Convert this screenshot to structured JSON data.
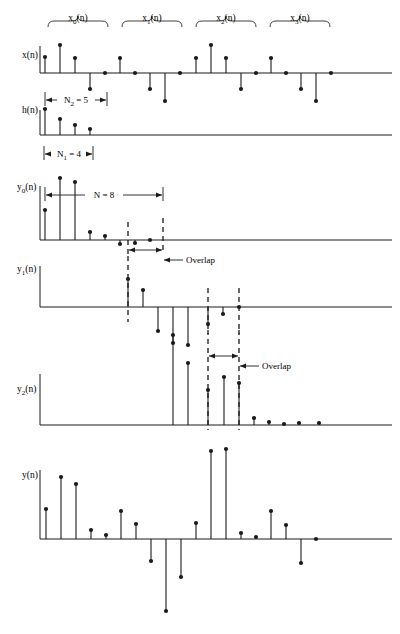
{
  "figure": {
    "width": 400,
    "height": 634,
    "ink_color": "#1a1a1a",
    "background": "#ffffff",
    "sample_spacing": 15
  },
  "braces": [
    {
      "name": "x0",
      "label_base": "x",
      "label_sub": "0",
      "label_tail": "(n)",
      "label_full": "x₀(n)",
      "x_start": 48,
      "x_end": 108,
      "label_x": 78,
      "label_y": 21,
      "y": 27
    },
    {
      "name": "x1",
      "label_base": "x",
      "label_sub": "1",
      "label_tail": "(n)",
      "label_full": "x₁(n)",
      "x_start": 122,
      "x_end": 182,
      "label_x": 152,
      "label_y": 21,
      "y": 27
    },
    {
      "name": "x2",
      "label_base": "x",
      "label_sub": "2",
      "label_tail": "(n)",
      "label_full": "x₂(n)",
      "x_start": 196,
      "x_end": 256,
      "label_x": 226,
      "label_y": 21,
      "y": 27
    },
    {
      "name": "x3",
      "label_base": "x",
      "label_sub": "3",
      "label_tail": "(n)",
      "label_full": "x₃(n)",
      "x_start": 270,
      "x_end": 330,
      "label_x": 300,
      "label_y": 21,
      "y": 27
    }
  ],
  "rows": [
    {
      "name": "x-of-n",
      "label_base": "x",
      "label_sub": "",
      "label_tail": "(n)",
      "label_full": "x(n)",
      "label_x": 22,
      "label_y": 58,
      "baseline_y": 73,
      "axis_x_start": 40,
      "axis_x_end": 392,
      "axis_left_cap_top": 46,
      "stems": [
        {
          "x": 45,
          "value": 16
        },
        {
          "x": 60,
          "value": 28
        },
        {
          "x": 75,
          "value": 15
        },
        {
          "x": 90,
          "value": -16
        },
        {
          "x": 105,
          "value": 0
        },
        {
          "x": 120,
          "value": 15
        },
        {
          "x": 135,
          "value": 0
        },
        {
          "x": 150,
          "value": -16
        },
        {
          "x": 165,
          "value": -28
        },
        {
          "x": 180,
          "value": 0
        },
        {
          "x": 196,
          "value": 15
        },
        {
          "x": 211,
          "value": 28
        },
        {
          "x": 226,
          "value": 15
        },
        {
          "x": 241,
          "value": -16
        },
        {
          "x": 256,
          "value": 0
        },
        {
          "x": 271,
          "value": 15
        },
        {
          "x": 286,
          "value": 0
        },
        {
          "x": 301,
          "value": -16
        },
        {
          "x": 316,
          "value": -28
        },
        {
          "x": 331,
          "value": 0
        }
      ]
    },
    {
      "name": "h-of-n",
      "label_base": "h",
      "label_sub": "",
      "label_tail": "(n)",
      "label_full": "h(n)",
      "label_x": 22,
      "label_y": 113,
      "baseline_y": 135,
      "axis_x_start": 40,
      "axis_x_end": 392,
      "axis_left_cap_top": 110,
      "stems": [
        {
          "x": 45,
          "value": 26
        },
        {
          "x": 60,
          "value": 16
        },
        {
          "x": 75,
          "value": 10
        },
        {
          "x": 90,
          "value": 6
        }
      ]
    },
    {
      "name": "y0-of-n",
      "label_base": "y",
      "label_sub": "0",
      "label_tail": "(n)",
      "label_full": "y₀(n)",
      "label_x": 17,
      "label_y": 190,
      "baseline_y": 240,
      "axis_x_start": 40,
      "axis_x_end": 392,
      "axis_left_cap_top": 186,
      "stems": [
        {
          "x": 45,
          "value": 30
        },
        {
          "x": 60,
          "value": 62
        },
        {
          "x": 75,
          "value": 58
        },
        {
          "x": 90,
          "value": 8
        },
        {
          "x": 105,
          "value": 4
        },
        {
          "x": 120,
          "value": -4
        },
        {
          "x": 135,
          "value": -3
        },
        {
          "x": 150,
          "value": 0
        }
      ]
    },
    {
      "name": "y1-of-n",
      "label_base": "y",
      "label_sub": "1",
      "label_tail": "(n)",
      "label_full": "y₁(n)",
      "label_x": 17,
      "label_y": 272,
      "baseline_y": 307,
      "axis_x_start": 40,
      "axis_x_end": 392,
      "axis_left_cap_top": 266,
      "stems": [
        {
          "x": 128,
          "value": 28
        },
        {
          "x": 143,
          "value": 17
        },
        {
          "x": 158,
          "value": -24
        },
        {
          "x": 173,
          "value": -36
        },
        {
          "x": 188,
          "value": -38
        },
        {
          "x": 208,
          "value": -17
        },
        {
          "x": 223,
          "value": -7
        },
        {
          "x": 239,
          "value": 0
        }
      ]
    },
    {
      "name": "y2-of-n",
      "label_base": "y",
      "label_sub": "2",
      "label_tail": "(n)",
      "label_full": "y₂(n)",
      "label_x": 17,
      "label_y": 392,
      "baseline_y": 425,
      "axis_x_start": 40,
      "axis_x_end": 392,
      "axis_left_cap_top": 374,
      "stems": [
        {
          "x": 173,
          "value": 90
        },
        {
          "x": 188,
          "value": 62
        },
        {
          "x": 208,
          "value": 35
        },
        {
          "x": 224,
          "value": 48
        },
        {
          "x": 239,
          "value": 42
        },
        {
          "x": 254,
          "value": 7
        },
        {
          "x": 269,
          "value": 3
        },
        {
          "x": 284,
          "value": 1
        },
        {
          "x": 299,
          "value": 2
        },
        {
          "x": 319,
          "value": 2
        }
      ]
    },
    {
      "name": "y-of-n",
      "label_base": "y",
      "label_sub": "",
      "label_tail": "(n)",
      "label_full": "y(n)",
      "label_x": 22,
      "label_y": 478,
      "baseline_y": 539,
      "axis_x_start": 40,
      "axis_x_end": 392,
      "axis_left_cap_top": 470,
      "stems": [
        {
          "x": 46,
          "value": 30
        },
        {
          "x": 61,
          "value": 62
        },
        {
          "x": 76,
          "value": 55
        },
        {
          "x": 91,
          "value": 9
        },
        {
          "x": 106,
          "value": 4
        },
        {
          "x": 121,
          "value": 28
        },
        {
          "x": 136,
          "value": 15
        },
        {
          "x": 151,
          "value": -22
        },
        {
          "x": 166,
          "value": -72
        },
        {
          "x": 181,
          "value": -38
        },
        {
          "x": 196,
          "value": 16
        },
        {
          "x": 211,
          "value": 88
        },
        {
          "x": 226,
          "value": 90
        },
        {
          "x": 241,
          "value": 6
        },
        {
          "x": 256,
          "value": 2
        },
        {
          "x": 271,
          "value": 28
        },
        {
          "x": 286,
          "value": 14
        },
        {
          "x": 301,
          "value": -24
        },
        {
          "x": 316,
          "value": 0
        }
      ]
    }
  ],
  "dashed_markers": [
    {
      "name": "y0-dash-left",
      "x": 128,
      "y_top": 222,
      "y_bottom": 258
    },
    {
      "name": "y0-dash-right",
      "x": 163,
      "y_top": 218,
      "y_bottom": 252
    },
    {
      "name": "y1-dash-left",
      "x": 128,
      "y_top": 256,
      "y_bottom": 322
    },
    {
      "name": "y1-dash-mid",
      "x": 208,
      "y_top": 288,
      "y_bottom": 334
    },
    {
      "name": "y1-dash-right",
      "x": 239,
      "y_top": 288,
      "y_bottom": 334
    },
    {
      "name": "y2-dash-left",
      "x": 208,
      "y_top": 330,
      "y_bottom": 430
    },
    {
      "name": "y2-dash-right",
      "x": 239,
      "y_top": 330,
      "y_bottom": 430
    }
  ],
  "measurements": [
    {
      "name": "n2-measure",
      "label_full": "N₂ = 5",
      "label_base": "N",
      "label_sub": "2",
      "label_tail": " = 5",
      "x_start": 45,
      "x_end": 107,
      "y": 100,
      "label_x": 76,
      "label_y": 103
    },
    {
      "name": "n1-measure",
      "label_full": "N₁ = 4",
      "label_base": "N",
      "label_sub": "1",
      "label_tail": " = 4",
      "x_start": 44,
      "x_end": 93,
      "y": 154,
      "label_x": 69,
      "label_y": 157
    },
    {
      "name": "n-measure",
      "label_full": "N = 8",
      "label_base": "N",
      "label_sub": "",
      "label_tail": " = 8",
      "x_start": 45,
      "x_end": 163,
      "y": 195,
      "label_x": 104,
      "label_y": 198
    }
  ],
  "overlap_annotations": [
    {
      "name": "overlap-y0",
      "label": "Overlap",
      "arrow_x_start": 128,
      "arrow_x_end": 163,
      "arrow_y": 250,
      "lead_from_x": 163,
      "lead_to_x": 183,
      "lead_y": 260,
      "text_x": 186,
      "text_y": 263
    },
    {
      "name": "overlap-y1",
      "label": "Overlap",
      "arrow_x_start": 208,
      "arrow_x_end": 239,
      "arrow_y": 356,
      "lead_from_x": 239,
      "lead_to_x": 259,
      "lead_y": 366,
      "text_x": 262,
      "text_y": 369
    }
  ]
}
